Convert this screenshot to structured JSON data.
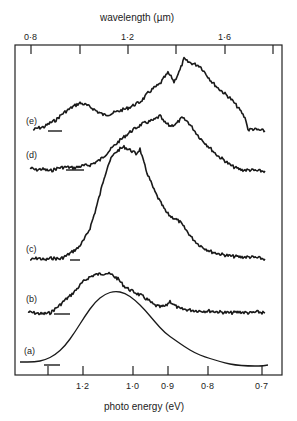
{
  "chart_data": {
    "type": "line",
    "title": "",
    "top_axis": {
      "label": "wavelength (µm)",
      "ticks": [
        "0·8",
        "1·2",
        "1·6"
      ],
      "tick_values": [
        0.8,
        1.0,
        1.2,
        1.4,
        1.6,
        1.8
      ]
    },
    "xlabel": "photo energy (eV)",
    "x_ticks": [
      "1·2",
      "1·0",
      "0·9",
      "0·8",
      "0·7"
    ],
    "x_tick_values": [
      1.3,
      1.2,
      1.0,
      0.9,
      0.8,
      0.7
    ],
    "ylabel": "",
    "grid": false,
    "legend": "inline labels (a)-(e), curves offset vertically",
    "series": [
      {
        "name": "(a)",
        "label": "(a)",
        "baseline_y": 365,
        "smooth": true,
        "points": [
          [
            20,
            362
          ],
          [
            35,
            362
          ],
          [
            45,
            360
          ],
          [
            55,
            355
          ],
          [
            65,
            346
          ],
          [
            75,
            332
          ],
          [
            85,
            316
          ],
          [
            95,
            302
          ],
          [
            105,
            294
          ],
          [
            115,
            291
          ],
          [
            125,
            293
          ],
          [
            135,
            300
          ],
          [
            145,
            310
          ],
          [
            155,
            322
          ],
          [
            165,
            333
          ],
          [
            175,
            340
          ],
          [
            185,
            347
          ],
          [
            195,
            353
          ],
          [
            205,
            357
          ],
          [
            215,
            360
          ],
          [
            225,
            363
          ],
          [
            235,
            365
          ],
          [
            248,
            366
          ],
          [
            262,
            366
          ],
          [
            268,
            365
          ]
        ]
      },
      {
        "name": "(b)",
        "label": "(b)",
        "baseline_y": 313,
        "smooth": false,
        "points": [
          [
            28,
            312
          ],
          [
            35,
            313
          ],
          [
            42,
            314
          ],
          [
            50,
            313
          ],
          [
            55,
            309
          ],
          [
            60,
            305
          ],
          [
            65,
            300
          ],
          [
            70,
            296
          ],
          [
            76,
            290
          ],
          [
            82,
            283
          ],
          [
            88,
            278
          ],
          [
            94,
            275
          ],
          [
            100,
            274
          ],
          [
            106,
            273
          ],
          [
            112,
            275
          ],
          [
            118,
            279
          ],
          [
            124,
            286
          ],
          [
            130,
            290
          ],
          [
            136,
            293
          ],
          [
            142,
            296
          ],
          [
            148,
            300
          ],
          [
            154,
            305
          ],
          [
            160,
            307
          ],
          [
            166,
            306
          ],
          [
            170,
            301
          ],
          [
            174,
            305
          ],
          [
            180,
            309
          ],
          [
            190,
            310
          ],
          [
            200,
            311
          ],
          [
            210,
            311
          ],
          [
            220,
            312
          ],
          [
            230,
            313
          ],
          [
            240,
            312
          ],
          [
            250,
            313
          ],
          [
            258,
            312
          ],
          [
            265,
            313
          ]
        ]
      },
      {
        "name": "(c)",
        "label": "(c)",
        "baseline_y": 259,
        "smooth": false,
        "points": [
          [
            30,
            260
          ],
          [
            38,
            258
          ],
          [
            45,
            260
          ],
          [
            52,
            258
          ],
          [
            60,
            259
          ],
          [
            66,
            256
          ],
          [
            72,
            252
          ],
          [
            78,
            248
          ],
          [
            84,
            240
          ],
          [
            90,
            228
          ],
          [
            95,
            212
          ],
          [
            100,
            194
          ],
          [
            104,
            178
          ],
          [
            108,
            165
          ],
          [
            112,
            157
          ],
          [
            116,
            152
          ],
          [
            120,
            149
          ],
          [
            124,
            147
          ],
          [
            128,
            149
          ],
          [
            132,
            151
          ],
          [
            136,
            154
          ],
          [
            140,
            149
          ],
          [
            143,
            160
          ],
          [
            146,
            170
          ],
          [
            150,
            180
          ],
          [
            154,
            190
          ],
          [
            158,
            198
          ],
          [
            162,
            205
          ],
          [
            166,
            212
          ],
          [
            170,
            216
          ],
          [
            174,
            218
          ],
          [
            180,
            222
          ],
          [
            186,
            230
          ],
          [
            192,
            238
          ],
          [
            198,
            244
          ],
          [
            204,
            248
          ],
          [
            212,
            252
          ],
          [
            220,
            254
          ],
          [
            230,
            256
          ],
          [
            240,
            257
          ],
          [
            250,
            257
          ],
          [
            258,
            258
          ],
          [
            265,
            259
          ]
        ]
      },
      {
        "name": "(d)",
        "label": "(d)",
        "baseline_y": 169,
        "smooth": false,
        "points": [
          [
            30,
            168
          ],
          [
            36,
            170
          ],
          [
            42,
            169
          ],
          [
            50,
            171
          ],
          [
            58,
            168
          ],
          [
            66,
            167
          ],
          [
            74,
            168
          ],
          [
            82,
            166
          ],
          [
            90,
            165
          ],
          [
            96,
            162
          ],
          [
            100,
            160
          ],
          [
            106,
            154
          ],
          [
            112,
            148
          ],
          [
            118,
            142
          ],
          [
            124,
            137
          ],
          [
            130,
            132
          ],
          [
            136,
            128
          ],
          [
            142,
            124
          ],
          [
            148,
            122
          ],
          [
            154,
            120
          ],
          [
            160,
            116
          ],
          [
            164,
            122
          ],
          [
            170,
            126
          ],
          [
            176,
            124
          ],
          [
            182,
            118
          ],
          [
            188,
            122
          ],
          [
            194,
            130
          ],
          [
            200,
            138
          ],
          [
            206,
            144
          ],
          [
            212,
            150
          ],
          [
            218,
            156
          ],
          [
            224,
            160
          ],
          [
            230,
            165
          ],
          [
            236,
            168
          ],
          [
            242,
            170
          ],
          [
            250,
            170
          ],
          [
            258,
            171
          ],
          [
            265,
            171
          ]
        ]
      },
      {
        "name": "(e)",
        "label": "(e)",
        "baseline_y": 132,
        "smooth": false,
        "points": [
          [
            33,
            130
          ],
          [
            38,
            128
          ],
          [
            44,
            127
          ],
          [
            50,
            123
          ],
          [
            56,
            120
          ],
          [
            62,
            114
          ],
          [
            68,
            110
          ],
          [
            74,
            106
          ],
          [
            80,
            103
          ],
          [
            86,
            105
          ],
          [
            92,
            108
          ],
          [
            98,
            112
          ],
          [
            104,
            115
          ],
          [
            110,
            114
          ],
          [
            116,
            112
          ],
          [
            122,
            110
          ],
          [
            128,
            108
          ],
          [
            134,
            105
          ],
          [
            140,
            102
          ],
          [
            144,
            98
          ],
          [
            148,
            93
          ],
          [
            154,
            88
          ],
          [
            160,
            84
          ],
          [
            164,
            78
          ],
          [
            168,
            73
          ],
          [
            172,
            78
          ],
          [
            174,
            82
          ],
          [
            176,
            78
          ],
          [
            180,
            70
          ],
          [
            184,
            59
          ],
          [
            188,
            62
          ],
          [
            194,
            64
          ],
          [
            200,
            66
          ],
          [
            206,
            74
          ],
          [
            212,
            82
          ],
          [
            218,
            88
          ],
          [
            224,
            93
          ],
          [
            230,
            98
          ],
          [
            236,
            105
          ],
          [
            242,
            113
          ],
          [
            246,
            120
          ],
          [
            248,
            130
          ],
          [
            252,
            129
          ],
          [
            258,
            130
          ],
          [
            265,
            131
          ]
        ]
      }
    ],
    "marker_dashes": [
      {
        "series": "(a)",
        "x1": 44,
        "x2": 60,
        "y": 365
      },
      {
        "series": "(b)",
        "x1": 54,
        "x2": 70,
        "y": 314
      },
      {
        "series": "(c)",
        "x1": 70,
        "x2": 80,
        "y": 260
      },
      {
        "series": "(d)",
        "x1": 66,
        "x2": 84,
        "y": 170
      },
      {
        "series": "(e)",
        "x1": 48,
        "x2": 62,
        "y": 131
      }
    ]
  },
  "labels": {
    "top_axis_title": "wavelength (µm)",
    "bottom_axis_title": "photo energy (eV)",
    "top_ticks": [
      {
        "text": "0·8",
        "x": 31
      },
      {
        "text": "1·2",
        "x": 128
      },
      {
        "text": "1·6",
        "x": 225
      }
    ],
    "bottom_ticks": [
      {
        "text": "1·2",
        "x": 83
      },
      {
        "text": "1·0",
        "x": 133
      },
      {
        "text": "0·9",
        "x": 168
      },
      {
        "text": "0·8",
        "x": 208
      },
      {
        "text": "0·7",
        "x": 262
      }
    ],
    "curve_labels": [
      {
        "text": "(e)",
        "x": 26,
        "y": 116
      },
      {
        "text": "(d)",
        "x": 26,
        "y": 150
      },
      {
        "text": "(c)",
        "x": 26,
        "y": 244
      },
      {
        "text": "(b)",
        "x": 26,
        "y": 294
      },
      {
        "text": "(a)",
        "x": 24,
        "y": 346
      }
    ]
  },
  "frame": {
    "left": 15,
    "right": 282,
    "top": 45,
    "bottom": 375,
    "top_tick_x": [
      31,
      80,
      128,
      176,
      225,
      273
    ],
    "bottom_tick_x": [
      48,
      83,
      133,
      168,
      208,
      262
    ]
  }
}
